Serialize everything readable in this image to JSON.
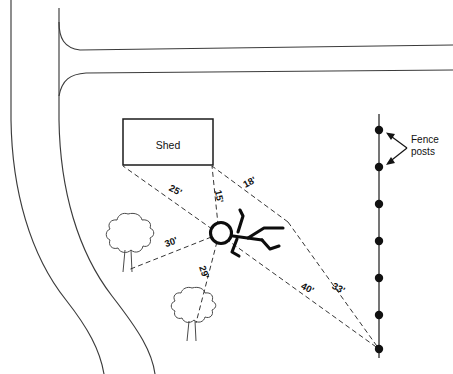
{
  "diagram": {
    "canvas": {
      "width": 453,
      "height": 374
    },
    "shed": {
      "label": "Shed",
      "x": 123,
      "y": 119,
      "width": 90,
      "height": 46
    },
    "observer": {
      "x": 219,
      "y": 234,
      "name": "person"
    },
    "measurements": [
      {
        "id": "m25",
        "label": "25'",
        "value": 25,
        "unit": "ft",
        "target": "shed-left-corner",
        "tx": 174,
        "ty": 193,
        "rotate": 28
      },
      {
        "id": "m15",
        "label": "15'",
        "value": 15,
        "unit": "ft",
        "target": "shed-right-corner",
        "tx": 216,
        "ty": 197,
        "rotate": 78
      },
      {
        "id": "m18",
        "label": "18'",
        "value": 18,
        "unit": "ft",
        "target": "shed-right-corner-far",
        "tx": 251,
        "ty": 185,
        "rotate": -28
      },
      {
        "id": "m30",
        "label": "30'",
        "value": 30,
        "unit": "ft",
        "target": "tree-left",
        "tx": 172,
        "ty": 245,
        "rotate": -20
      },
      {
        "id": "m29",
        "label": "29'",
        "value": 29,
        "unit": "ft",
        "target": "tree-lower",
        "tx": 201,
        "ty": 273,
        "rotate": 72
      },
      {
        "id": "m40",
        "label": "40'",
        "value": 40,
        "unit": "ft",
        "target": "fence-post-bottom",
        "tx": 306,
        "ty": 291,
        "rotate": 28
      },
      {
        "id": "m33",
        "label": "33'",
        "value": 33,
        "unit": "ft",
        "target": "fence-post-bottom",
        "tx": 337,
        "ty": 291,
        "rotate": 28
      }
    ],
    "fence": {
      "label_line1": "Fence",
      "label_line2": "posts",
      "x": 379,
      "y_top": 114,
      "y_bottom": 358,
      "post_count": 7,
      "posts_y": [
        130,
        167,
        204,
        241,
        278,
        315,
        349
      ]
    },
    "trees": [
      {
        "id": "tree-left",
        "cx": 128,
        "cy": 236,
        "r": 21
      },
      {
        "id": "tree-lower",
        "cx": 192,
        "cy": 307,
        "r": 19
      }
    ],
    "colors": {
      "ink": "#111111",
      "road": "#3b3b3b",
      "dash": "#2a2a2a",
      "background": "#ffffff"
    }
  }
}
